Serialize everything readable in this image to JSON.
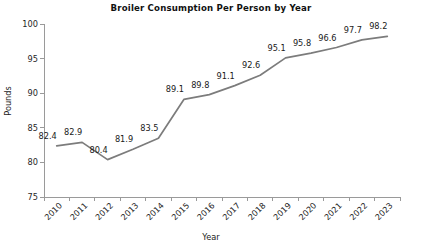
{
  "chart_data": {
    "type": "line",
    "title": "Broiler Consumption Per Person by Year",
    "xlabel": "Year",
    "ylabel": "Pounds",
    "categories": [
      "2010",
      "2011",
      "2012",
      "2013",
      "2014",
      "2015",
      "2016",
      "2017",
      "2018",
      "2019",
      "2020",
      "2021",
      "2022",
      "2023"
    ],
    "values": [
      82.4,
      82.9,
      80.4,
      81.9,
      83.5,
      89.1,
      89.8,
      91.1,
      92.6,
      95.1,
      95.8,
      96.6,
      97.7,
      98.2
    ],
    "value_labels": [
      "82.4",
      "82.9",
      "80.4",
      "81.9",
      "83.5",
      "89.1",
      "89.8",
      "91.1",
      "92.6",
      "95.1",
      "95.8",
      "96.6",
      "97.7",
      "98.2"
    ],
    "ylim": [
      75,
      100
    ],
    "yticks": [
      75,
      80,
      85,
      90,
      95,
      100
    ],
    "ytick_labels": [
      "75",
      "80",
      "85",
      "90",
      "95",
      "100"
    ],
    "grid": false,
    "legend": "none",
    "series_color": "#7c7c7c",
    "axis_color": "#9a9a9a",
    "text_color": "#1a1a1a",
    "xtick_rotation_deg": 45,
    "data_label_position": "above-left"
  }
}
